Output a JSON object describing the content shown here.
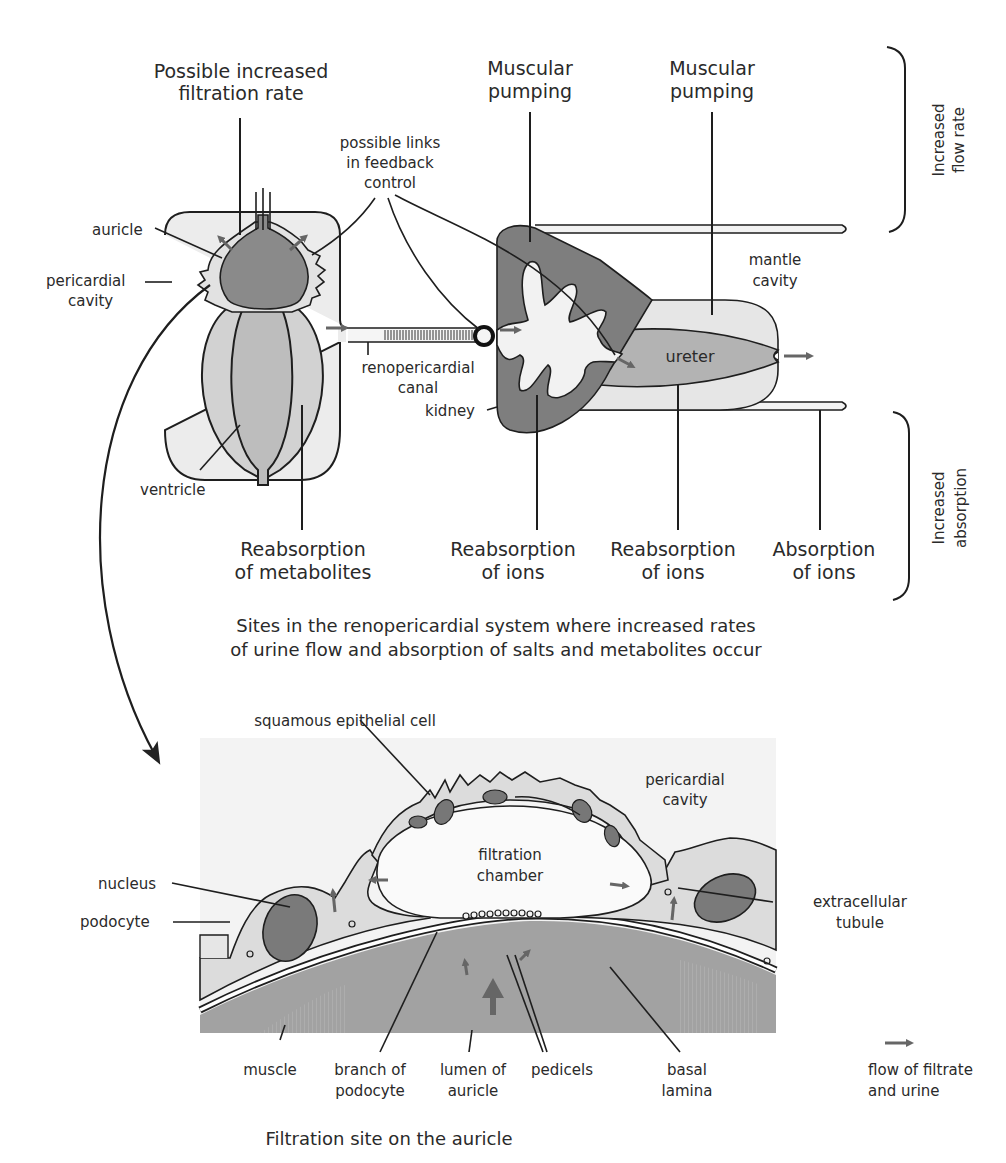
{
  "colors": {
    "dark_fill": "#7a7a7a",
    "mid_fill": "#b0b0b0",
    "light_fill": "#d9d9d9",
    "pale_fill": "#ececec",
    "bg_panel": "#f3f3f3",
    "line": "#1e1e1e",
    "flow_arrow": "#666666"
  },
  "top_panel": {
    "annotations": {
      "possible_increased_filtration_rate": [
        "Possible increased",
        "filtration rate"
      ],
      "muscular_pumping_kidney": [
        "Muscular",
        "pumping"
      ],
      "muscular_pumping_ureter": [
        "Muscular",
        "pumping"
      ],
      "possible_links": [
        "possible links",
        "in feedback",
        "control"
      ]
    },
    "labels": {
      "auricle": "auricle",
      "pericardial_cavity": [
        "pericardial",
        "cavity"
      ],
      "ventricle": "ventricle",
      "renopericardial_canal": [
        "renopericardial",
        "canal"
      ],
      "kidney": "kidney",
      "ureter": "ureter",
      "mantle_cavity": [
        "mantle",
        "cavity"
      ]
    },
    "bottom_labels": [
      [
        "Reabsorption",
        "of metabolites"
      ],
      [
        "Reabsorption",
        "of ions"
      ],
      [
        "Reabsorption",
        "of ions"
      ],
      [
        "Absorption",
        "of ions"
      ]
    ],
    "brackets": {
      "increased_flow_rate": [
        "Increased",
        "flow rate"
      ],
      "increased_absorption": [
        "Increased",
        "absorption"
      ]
    },
    "caption": [
      "Sites in the renopericardial system where increased rates",
      "of urine flow and absorption of salts and metabolites occur"
    ]
  },
  "bottom_panel": {
    "labels": {
      "squamous_epithelial_cell": "squamous epithelial cell",
      "pericardial_cavity": [
        "pericardial",
        "cavity"
      ],
      "filtration_chamber": [
        "filtration",
        "chamber"
      ],
      "nucleus": "nucleus",
      "podocyte": "podocyte",
      "extracellular_tubule": [
        "extracellular",
        "tubule"
      ]
    },
    "bottom_labels": [
      [
        "muscle"
      ],
      [
        "branch of",
        "podocyte"
      ],
      [
        "lumen of",
        "auricle"
      ],
      [
        "pedicels"
      ],
      [
        "basal",
        "lamina"
      ]
    ],
    "legend": {
      "icon": "flow-arrow-icon",
      "text": [
        "flow of filtrate",
        "and urine"
      ]
    },
    "caption": "Filtration site on the auricle"
  }
}
